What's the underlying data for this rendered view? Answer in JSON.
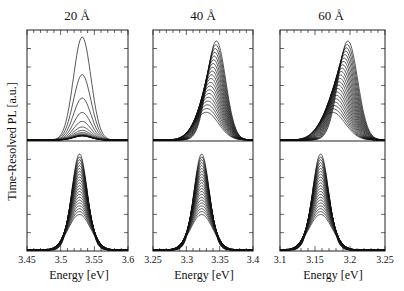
{
  "figure": {
    "ylabel": "Time-Resolved PL [a.u.]",
    "xlabel": "Energy [eV]",
    "panels": [
      {
        "title": "20 Å",
        "xticks": [
          "3.45",
          "3.5",
          "3.55",
          "3.6"
        ],
        "xlim": [
          3.45,
          3.6
        ],
        "peak_top": 3.532,
        "peak_bottom": 3.528
      },
      {
        "title": "40 Å",
        "xticks": [
          "3.25",
          "3.3",
          "3.35",
          "3.4"
        ],
        "xlim": [
          3.25,
          3.4
        ],
        "peak_top": 3.345,
        "peak_bottom": 3.323
      },
      {
        "title": "60 Å",
        "xticks": [
          "3.1",
          "3.15",
          "3.2",
          "3.25"
        ],
        "xlim": [
          3.1,
          3.25
        ],
        "peak_top": 3.197,
        "peak_bottom": 3.158
      }
    ]
  },
  "chart_data": {
    "type": "line",
    "xlabel": "Energy [eV]",
    "ylabel": "Time-Resolved PL [a.u.]",
    "grid": false,
    "layout": "3 columns × 2 rows (top: experiment-like, bottom: normalized/simulated families)",
    "panels": [
      {
        "title": "20 Å",
        "xlim": [
          3.45,
          3.6
        ],
        "xticks": [
          3.45,
          3.5,
          3.55,
          3.6
        ],
        "top": {
          "n_curves": 16,
          "peak_energy_eV": 3.532,
          "fwhm_eV": 0.03,
          "note": "peak amplitude decays strongly with time; nearly no shift"
        },
        "bottom": {
          "n_curves": 22,
          "peak_energy_eV": 3.528,
          "fwhm_eV": 0.03,
          "note": "family of Gaussians, amplitude 0.37–1.0"
        }
      },
      {
        "title": "40 Å",
        "xlim": [
          3.25,
          3.4
        ],
        "xticks": [
          3.25,
          3.3,
          3.35,
          3.4
        ],
        "top": {
          "n_curves": 20,
          "peak_energy_eV_start": 3.345,
          "peak_energy_eV_end": 3.33,
          "note": "red-shift with decreasing intensity"
        },
        "bottom": {
          "n_curves": 22,
          "peak_energy_eV": 3.323,
          "note": "family of Gaussians, amplitude 0.37–1.0"
        }
      },
      {
        "title": "60 Å",
        "xlim": [
          3.1,
          3.25
        ],
        "xticks": [
          3.1,
          3.15,
          3.2,
          3.25
        ],
        "top": {
          "n_curves": 22,
          "peak_energy_eV_start": 3.197,
          "peak_energy_eV_end": 3.175,
          "note": "red-shift with decreasing intensity"
        },
        "bottom": {
          "n_curves": 22,
          "peak_energy_eV": 3.158,
          "note": "family of Gaussians, amplitude 0.37–1.0"
        }
      }
    ]
  }
}
